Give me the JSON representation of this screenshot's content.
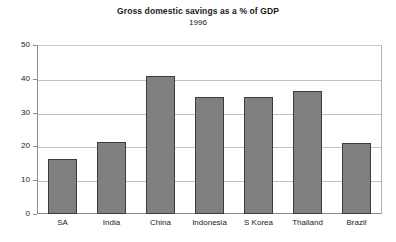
{
  "chart_data": {
    "type": "bar",
    "title": "Gross domestic savings as a % of GDP",
    "subtitle": "1996",
    "xlabel": "",
    "ylabel": "",
    "categories": [
      "SA",
      "India",
      "China",
      "Indonesia",
      "S Korea",
      "Thailand",
      "Brazil"
    ],
    "values": [
      16.3,
      21.3,
      41.0,
      34.7,
      34.7,
      36.5,
      21.2
    ],
    "series": [
      {
        "name": "Gross domestic savings (% of GDP), 1996",
        "values": [
          16.3,
          21.3,
          41.0,
          34.7,
          34.7,
          36.5,
          21.2
        ]
      }
    ],
    "ylim": [
      0,
      50
    ],
    "yticks": [
      0,
      10,
      20,
      30,
      40,
      50
    ],
    "ytick_labels": [
      "0",
      "10",
      "20",
      "30",
      "40",
      "50"
    ],
    "grid": true,
    "grid_axis": "y",
    "legend": false,
    "legend_position": "none",
    "bar_color": "#808080",
    "bar_edge_color": "#3c3c3c",
    "plot_background": "#ffffff",
    "grid_color": "#c0c0c0",
    "axis_color": "#8c8c8c"
  }
}
